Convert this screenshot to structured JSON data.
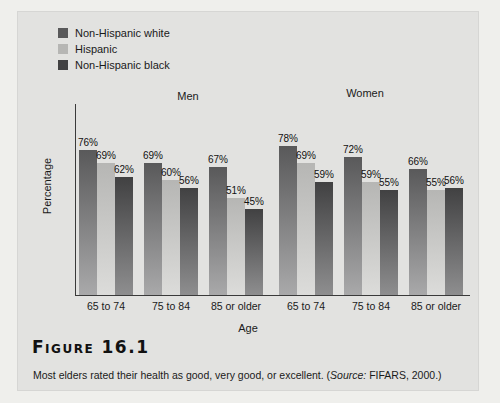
{
  "figure": {
    "number_label": "Figure 16.1",
    "caption_main": "Most elders rated their health as good, very good, or excellent. (",
    "caption_source_italic": "Source:",
    "caption_source_rest": " FIFARS, 2000.)"
  },
  "colors": {
    "panel_bg": "#e2e2e0",
    "page_bg": "#efefec",
    "axis": "#3a3a3a",
    "series_nhwhite_top": "#59595a",
    "series_nhwhite_bottom": "#a9a9aa",
    "series_hispanic_top": "#b6b6b4",
    "series_hispanic_bottom": "#dcdcda",
    "series_nhblack_top": "#414142",
    "series_nhblack_bottom": "#8e8e8f"
  },
  "legend": {
    "items": [
      {
        "label": "Non-Hispanic white",
        "swatch": "#59595a"
      },
      {
        "label": "Hispanic",
        "swatch": "#b6b6b4"
      },
      {
        "label": "Non-Hispanic black",
        "swatch": "#414142"
      }
    ]
  },
  "chart_data": {
    "type": "bar",
    "title": "",
    "xlabel": "Age",
    "ylabel": "Percentage",
    "ylim": [
      0,
      100
    ],
    "grid": false,
    "legend_position": "top-left",
    "group_titles": [
      "Men",
      "Women"
    ],
    "categories": [
      "65 to 74",
      "75 to 84",
      "85 or older",
      "65 to 74",
      "75 to 84",
      "85 or older"
    ],
    "category_group": [
      "Men",
      "Men",
      "Men",
      "Women",
      "Women",
      "Women"
    ],
    "series": [
      {
        "name": "Non-Hispanic white",
        "values": [
          76,
          69,
          67,
          78,
          72,
          66
        ]
      },
      {
        "name": "Hispanic",
        "values": [
          69,
          60,
          51,
          69,
          59,
          55
        ]
      },
      {
        "name": "Non-Hispanic black",
        "values": [
          62,
          56,
          45,
          59,
          55,
          56
        ]
      }
    ],
    "value_labels": [
      [
        "76%",
        "69%",
        "62%"
      ],
      [
        "69%",
        "60%",
        "56%"
      ],
      [
        "67%",
        "51%",
        "45%"
      ],
      [
        "78%",
        "69%",
        "59%"
      ],
      [
        "72%",
        "59%",
        "55%"
      ],
      [
        "66%",
        "55%",
        "56%"
      ]
    ]
  }
}
